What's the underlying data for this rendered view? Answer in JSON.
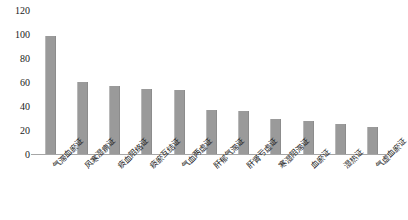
{
  "chart_data": {
    "type": "bar",
    "title": "",
    "xlabel": "",
    "ylabel": "",
    "ylim": [
      0,
      120
    ],
    "yticks": [
      0,
      20,
      40,
      60,
      80,
      100,
      120
    ],
    "grid": false,
    "legend": "none",
    "bar_color": "#9a9a9a",
    "categories": [
      "气滞血瘀证",
      "风寒湿痹证",
      "痰血阻络证",
      "痰瘀互结证",
      "气血两虚证",
      "肝郁气滞证",
      "肝肾亏虚证",
      "寒湿阻滞证",
      "血瘀证",
      "湿热证",
      "气虚血瘀证"
    ],
    "values": [
      96,
      58,
      55,
      53,
      52,
      36,
      35,
      28,
      27,
      24,
      22
    ]
  }
}
